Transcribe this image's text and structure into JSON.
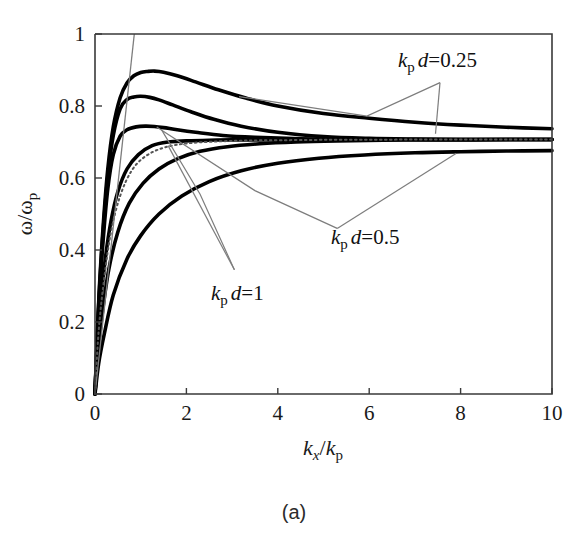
{
  "figure": {
    "caption": "(a)",
    "background": "#ffffff",
    "curve_color": "#000000",
    "axis_color": "#3a3a3a",
    "leader_color": "#7d7d7d"
  },
  "chart_data": {
    "type": "line",
    "title": "",
    "subtitle": "",
    "xlabel": "k_x / k_p",
    "ylabel": "omega / omega_p",
    "xlabel_parts": {
      "k1": "k",
      "sub1": "x",
      "slash": "/",
      "k2": "k",
      "sub2": "p"
    },
    "ylabel_parts": {
      "w1": "ω",
      "slash": "/",
      "w2": "ω",
      "sub": "p"
    },
    "xlim": [
      0,
      10
    ],
    "ylim": [
      0,
      1
    ],
    "xticks": [
      0,
      2,
      4,
      6,
      8,
      10
    ],
    "xtick_labels": [
      "0",
      "2",
      "4",
      "6",
      "8",
      "10"
    ],
    "yticks": [
      0,
      0.2,
      0.4,
      0.6,
      0.8,
      1
    ],
    "ytick_labels": [
      "0",
      "0.2",
      "0.4",
      "0.6",
      "0.8",
      "1"
    ],
    "grid": false,
    "legend": "none",
    "asymptote": 0.707,
    "annotations": [
      {
        "id": "ann-025",
        "text": "k_p d=0.25",
        "k": "k",
        "sub": "p",
        "d": "d",
        "eq": "=0.25",
        "x": 7.9,
        "y": 0.905
      },
      {
        "id": "ann-05",
        "text": "k_p d=0.5",
        "k": "k",
        "sub": "p",
        "d": "d",
        "eq": "=0.5",
        "x": 5.7,
        "y": 0.435
      },
      {
        "id": "ann-1",
        "text": "k_p d=1",
        "k": "k",
        "sub": "p",
        "d": "d",
        "eq": "=1",
        "x": 2.9,
        "y": 0.305
      }
    ],
    "series": [
      {
        "name": "kpd=0.25 upper branch",
        "style": "solid",
        "x": [
          0,
          0.05,
          0.1,
          0.18,
          0.28,
          0.4,
          0.55,
          0.7,
          0.85,
          1.0,
          1.15,
          1.3,
          1.5,
          1.8,
          2.2,
          2.7,
          3.3,
          4.0,
          5.0,
          6.0,
          7.0,
          8.0,
          9.0,
          10.0
        ],
        "y": [
          0.0,
          0.165,
          0.305,
          0.47,
          0.625,
          0.742,
          0.823,
          0.864,
          0.884,
          0.893,
          0.896,
          0.897,
          0.894,
          0.884,
          0.867,
          0.845,
          0.822,
          0.8,
          0.779,
          0.766,
          0.755,
          0.747,
          0.741,
          0.737
        ]
      },
      {
        "name": "kpd=0.5 upper branch",
        "style": "solid",
        "x": [
          0,
          0.05,
          0.1,
          0.18,
          0.28,
          0.4,
          0.55,
          0.7,
          0.85,
          1.0,
          1.2,
          1.4,
          1.7,
          2.1,
          2.6,
          3.2,
          4.0,
          5.0,
          6.0,
          7.0,
          8.0,
          9.0,
          10.0
        ],
        "y": [
          0.0,
          0.16,
          0.295,
          0.455,
          0.605,
          0.718,
          0.792,
          0.818,
          0.825,
          0.827,
          0.824,
          0.817,
          0.803,
          0.784,
          0.763,
          0.744,
          0.727,
          0.715,
          0.71,
          0.708,
          0.707,
          0.707,
          0.707
        ]
      },
      {
        "name": "kpd=1 upper branch",
        "style": "solid",
        "x": [
          0,
          0.05,
          0.1,
          0.18,
          0.28,
          0.4,
          0.55,
          0.7,
          0.9,
          1.1,
          1.3,
          1.5,
          1.8,
          2.2,
          2.8,
          3.5,
          4.5,
          5.5,
          6.5,
          7.5,
          8.5,
          10.0
        ],
        "y": [
          0.0,
          0.15,
          0.28,
          0.43,
          0.57,
          0.665,
          0.716,
          0.734,
          0.742,
          0.744,
          0.743,
          0.74,
          0.734,
          0.727,
          0.718,
          0.713,
          0.709,
          0.708,
          0.707,
          0.707,
          0.707,
          0.707
        ]
      },
      {
        "name": "kpd=0.25 lower branch",
        "style": "solid",
        "x": [
          0,
          0.05,
          0.12,
          0.22,
          0.35,
          0.5,
          0.7,
          0.95,
          1.25,
          1.6,
          2.0,
          2.5,
          3.0,
          3.6,
          4.3,
          5.2,
          6.2,
          7.2,
          8.2,
          9.1,
          10.0
        ],
        "y": [
          0.0,
          0.135,
          0.25,
          0.37,
          0.48,
          0.562,
          0.625,
          0.665,
          0.69,
          0.7,
          0.703,
          0.705,
          0.706,
          0.706,
          0.707,
          0.707,
          0.707,
          0.707,
          0.707,
          0.707,
          0.707
        ]
      },
      {
        "name": "kpd=0.5 lower branch",
        "style": "solid",
        "x": [
          0,
          0.06,
          0.15,
          0.3,
          0.5,
          0.75,
          1.05,
          1.4,
          1.8,
          2.3,
          2.9,
          3.6,
          4.4,
          5.3,
          6.3,
          7.3,
          8.3,
          9.2,
          10.0
        ],
        "y": [
          0.0,
          0.11,
          0.215,
          0.345,
          0.45,
          0.53,
          0.585,
          0.625,
          0.653,
          0.674,
          0.687,
          0.695,
          0.7,
          0.703,
          0.705,
          0.706,
          0.706,
          0.707,
          0.707
        ]
      },
      {
        "name": "kpd=1 lower branch",
        "style": "solid",
        "x": [
          0,
          0.08,
          0.2,
          0.4,
          0.7,
          1.0,
          1.4,
          1.9,
          2.5,
          3.2,
          4.0,
          4.9,
          5.9,
          7.0,
          8.0,
          9.0,
          10.0
        ],
        "y": [
          0.0,
          0.085,
          0.165,
          0.275,
          0.375,
          0.44,
          0.5,
          0.55,
          0.59,
          0.62,
          0.641,
          0.655,
          0.664,
          0.67,
          0.673,
          0.675,
          0.676
        ]
      },
      {
        "name": "single interface (dotted)",
        "style": "dotted",
        "x": [
          0,
          0.08,
          0.2,
          0.35,
          0.55,
          0.8,
          1.1,
          1.5,
          2.0,
          2.6,
          3.3,
          4.1,
          5.0,
          6.0,
          7.0,
          8.0,
          9.0,
          10.0
        ],
        "y": [
          0.0,
          0.175,
          0.32,
          0.45,
          0.55,
          0.62,
          0.66,
          0.684,
          0.696,
          0.701,
          0.704,
          0.705,
          0.706,
          0.706,
          0.707,
          0.707,
          0.707,
          0.707
        ]
      },
      {
        "name": "light line",
        "style": "light",
        "x": [
          0,
          0.86
        ],
        "y": [
          0.0,
          1.0
        ]
      }
    ],
    "leaders": [
      {
        "name": "leader-025-a",
        "points": [
          [
            7.55,
            0.865
          ],
          [
            5.95,
            0.772
          ],
          [
            3.15,
            0.826
          ]
        ]
      },
      {
        "name": "leader-025-b",
        "points": [
          [
            7.55,
            0.865
          ],
          [
            7.45,
            0.723
          ]
        ]
      },
      {
        "name": "leader-05-a",
        "points": [
          [
            5.3,
            0.46
          ],
          [
            3.5,
            0.565
          ],
          [
            1.35,
            0.742
          ]
        ]
      },
      {
        "name": "leader-05-b",
        "points": [
          [
            5.3,
            0.46
          ],
          [
            7.9,
            0.668
          ]
        ]
      },
      {
        "name": "leader-1-a",
        "points": [
          [
            3.05,
            0.345
          ],
          [
            2.3,
            0.555
          ],
          [
            1.45,
            0.735
          ]
        ]
      },
      {
        "name": "leader-1-b",
        "points": [
          [
            3.05,
            0.345
          ],
          [
            1.6,
            0.69
          ]
        ]
      }
    ]
  }
}
